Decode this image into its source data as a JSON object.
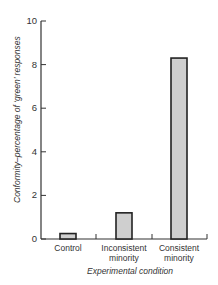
{
  "chart_data": {
    "type": "bar",
    "title": "",
    "xlabel": "Experimental condition",
    "ylabel": "Conformity–percentage of ‘green’ responses",
    "categories": [
      "Control",
      "Inconsistent minority",
      "Consistent minority"
    ],
    "category_lines": [
      [
        "Control"
      ],
      [
        "Inconsistent",
        "minority"
      ],
      [
        "Consistent",
        "minority"
      ]
    ],
    "values": [
      0.25,
      1.2,
      8.3
    ],
    "ylim": [
      0,
      10
    ],
    "yticks": [
      0,
      2,
      4,
      6,
      8,
      10
    ],
    "grid": false,
    "legend": null,
    "bar_fill": "#cfcfcf",
    "bar_edge": "#222222"
  }
}
